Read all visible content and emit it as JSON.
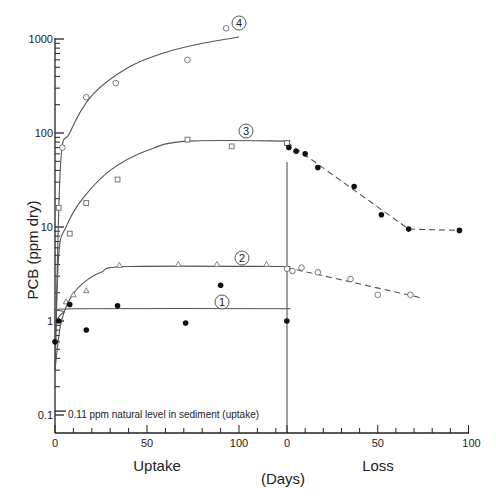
{
  "chart_data": {
    "type": "scatter",
    "title": "",
    "ylabel": "PCB (ppm dry)",
    "xlabel": "(Days)",
    "yscale": "log",
    "ylim": [
      0.1,
      1000
    ],
    "y_ticks": [
      "1000",
      "100",
      "10",
      "1",
      "0.1"
    ],
    "panels": [
      {
        "name": "Uptake",
        "x_ticks": [
          "0",
          "50",
          "100"
        ],
        "xlim": [
          0,
          128
        ]
      },
      {
        "name": "Loss",
        "x_ticks": [
          "0",
          "50",
          "100"
        ],
        "xlim": [
          0,
          100
        ]
      }
    ],
    "annotation": "0.11 ppm natural level in sediment (uptake)",
    "series": [
      {
        "name": "4",
        "marker": "open-circle",
        "phase": "uptake",
        "points": [
          [
            4,
            70
          ],
          [
            17,
            240
          ],
          [
            33,
            340
          ],
          [
            72,
            600
          ],
          [
            93,
            1300
          ]
        ],
        "fit": [
          [
            0,
            0.3
          ],
          [
            3,
            45
          ],
          [
            8,
            100
          ],
          [
            20,
            250
          ],
          [
            40,
            500
          ],
          [
            60,
            720
          ],
          [
            80,
            900
          ],
          [
            100,
            1050
          ]
        ]
      },
      {
        "name": "3",
        "marker": "open-square",
        "phase": "uptake",
        "points": [
          [
            2,
            16
          ],
          [
            8,
            8.5
          ],
          [
            17,
            18
          ],
          [
            34,
            32
          ],
          [
            72,
            85
          ],
          [
            96,
            72
          ],
          [
            126,
            78
          ]
        ],
        "fit": [
          [
            0,
            0.3
          ],
          [
            2,
            5
          ],
          [
            6,
            10
          ],
          [
            15,
            20
          ],
          [
            30,
            40
          ],
          [
            50,
            65
          ],
          [
            72,
            82
          ],
          [
            128,
            82
          ]
        ],
        "loss_points": [
          [
            0,
            78
          ]
        ]
      },
      {
        "name": "2",
        "marker": "open-triangle",
        "phase": "uptake",
        "points": [
          [
            6,
            1.6
          ],
          [
            10,
            1.9
          ],
          [
            17,
            2.1
          ],
          [
            35,
            3.9
          ],
          [
            67,
            4.0
          ],
          [
            88,
            4.0
          ],
          [
            115,
            4.0
          ]
        ],
        "fit": [
          [
            0,
            0.3
          ],
          [
            3,
            0.9
          ],
          [
            8,
            1.7
          ],
          [
            15,
            2.5
          ],
          [
            25,
            3.3
          ],
          [
            40,
            3.8
          ],
          [
            128,
            3.8
          ]
        ],
        "loss_points": [
          [
            0,
            3.6
          ],
          [
            3,
            3.4
          ],
          [
            8,
            3.7
          ],
          [
            17,
            3.3
          ],
          [
            35,
            2.8
          ],
          [
            50,
            1.9
          ],
          [
            68,
            1.9
          ]
        ],
        "loss_fit": [
          [
            0,
            3.7
          ],
          [
            75,
            1.75
          ]
        ]
      },
      {
        "name": "1",
        "marker": "filled-circle",
        "phase": "uptake",
        "points": [
          [
            0,
            0.6
          ],
          [
            2,
            1.0
          ],
          [
            8,
            1.5
          ],
          [
            17,
            0.8
          ],
          [
            34,
            1.45
          ],
          [
            71,
            0.95
          ],
          [
            90,
            2.4
          ],
          [
            126,
            1.0
          ]
        ],
        "fit": [
          [
            0,
            0.9
          ],
          [
            2,
            1.1
          ],
          [
            5,
            1.25
          ],
          [
            10,
            1.35
          ],
          [
            128,
            1.35
          ]
        ]
      },
      {
        "name": "loss (from 3)",
        "marker": "filled-circle",
        "phase": "loss",
        "points": [
          [
            1,
            70
          ],
          [
            5,
            64
          ],
          [
            10,
            60
          ],
          [
            17,
            43
          ],
          [
            37,
            27
          ],
          [
            52,
            13.5
          ],
          [
            67,
            9.5
          ],
          [
            95,
            9.2
          ]
        ],
        "fit": [
          [
            0,
            80
          ],
          [
            67,
            9.5
          ],
          [
            95,
            9.2
          ]
        ]
      }
    ],
    "curve_labels": [
      {
        "label": "4",
        "x_px": 239,
        "y_px": 23
      },
      {
        "label": "3",
        "x_px": 246,
        "y_px": 131
      },
      {
        "label": "2",
        "x_px": 242,
        "y_px": 258
      },
      {
        "label": "1",
        "x_px": 222,
        "y_px": 302
      }
    ],
    "section_labels": {
      "uptake": "Uptake",
      "loss": "Loss",
      "days": "(Days)"
    }
  }
}
